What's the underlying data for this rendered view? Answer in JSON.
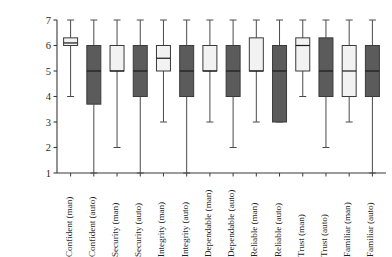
{
  "chart_data": {
    "type": "box",
    "title": "",
    "xlabel": "",
    "ylabel": "Raw scale score",
    "ylim": [
      1,
      7
    ],
    "yticks": [
      1,
      2,
      3,
      4,
      5,
      6,
      7
    ],
    "ytick_labels": [
      "1",
      "2",
      "3",
      "4",
      "5",
      "6",
      "7"
    ],
    "grid": false,
    "legend": "none",
    "fill_colors": {
      "manual": "#f2f2f2",
      "automated": "#5b5b5b"
    },
    "categories": [
      "Confident (man)",
      "Confident (auto)",
      "Security (man)",
      "Security (auto)",
      "Integrity (man)",
      "Integrity (auto)",
      "Dependable (man)",
      "Dependable (auto)",
      "Reliable (man)",
      "Reliable (auto)",
      "Trust (man)",
      "Trust (auto)",
      "Familiar (man)",
      "Familiar (auto)"
    ],
    "boxes": [
      {
        "label": "Confident (man)",
        "condition": "manual",
        "fill": "#f2f2f2",
        "whisker_low": 4.0,
        "q1": 6.0,
        "median": 6.1,
        "q3": 6.3,
        "whisker_high": 7.0
      },
      {
        "label": "Confident (auto)",
        "condition": "automated",
        "fill": "#5b5b5b",
        "whisker_low": 1.0,
        "q1": 3.7,
        "median": 5.0,
        "q3": 6.0,
        "whisker_high": 7.0
      },
      {
        "label": "Security (man)",
        "condition": "manual",
        "fill": "#f2f2f2",
        "whisker_low": 2.0,
        "q1": 5.0,
        "median": 5.0,
        "q3": 6.0,
        "whisker_high": 7.0
      },
      {
        "label": "Security (auto)",
        "condition": "automated",
        "fill": "#5b5b5b",
        "whisker_low": 1.0,
        "q1": 4.0,
        "median": 5.0,
        "q3": 6.0,
        "whisker_high": 7.0
      },
      {
        "label": "Integrity (man)",
        "condition": "manual",
        "fill": "#f2f2f2",
        "whisker_low": 3.0,
        "q1": 5.0,
        "median": 5.5,
        "q3": 6.0,
        "whisker_high": 7.0
      },
      {
        "label": "Integrity (auto)",
        "condition": "automated",
        "fill": "#5b5b5b",
        "whisker_low": 1.0,
        "q1": 4.0,
        "median": 5.0,
        "q3": 6.0,
        "whisker_high": 7.0
      },
      {
        "label": "Dependable (man)",
        "condition": "manual",
        "fill": "#f2f2f2",
        "whisker_low": 3.0,
        "q1": 5.0,
        "median": 5.0,
        "q3": 6.0,
        "whisker_high": 7.0
      },
      {
        "label": "Dependable (auto)",
        "condition": "automated",
        "fill": "#5b5b5b",
        "whisker_low": 2.0,
        "q1": 4.0,
        "median": 5.0,
        "q3": 6.0,
        "whisker_high": 7.0
      },
      {
        "label": "Reliable (man)",
        "condition": "manual",
        "fill": "#f2f2f2",
        "whisker_low": 3.0,
        "q1": 5.0,
        "median": 5.0,
        "q3": 6.3,
        "whisker_high": 7.0
      },
      {
        "label": "Reliable (auto)",
        "condition": "automated",
        "fill": "#5b5b5b",
        "whisker_low": 3.0,
        "q1": 3.0,
        "median": 5.0,
        "q3": 6.0,
        "whisker_high": 7.0
      },
      {
        "label": "Trust (man)",
        "condition": "manual",
        "fill": "#f2f2f2",
        "whisker_low": 4.0,
        "q1": 5.0,
        "median": 6.0,
        "q3": 6.3,
        "whisker_high": 7.0
      },
      {
        "label": "Trust (auto)",
        "condition": "automated",
        "fill": "#5b5b5b",
        "whisker_low": 2.0,
        "q1": 4.0,
        "median": 5.0,
        "q3": 6.3,
        "whisker_high": 7.0
      },
      {
        "label": "Familiar (man)",
        "condition": "manual",
        "fill": "#f2f2f2",
        "whisker_low": 3.0,
        "q1": 4.0,
        "median": 5.0,
        "q3": 6.0,
        "whisker_high": 7.0
      },
      {
        "label": "Familiar (auto)",
        "condition": "automated",
        "fill": "#5b5b5b",
        "whisker_low": 1.0,
        "q1": 4.0,
        "median": 5.0,
        "q3": 6.0,
        "whisker_high": 7.0
      }
    ]
  }
}
